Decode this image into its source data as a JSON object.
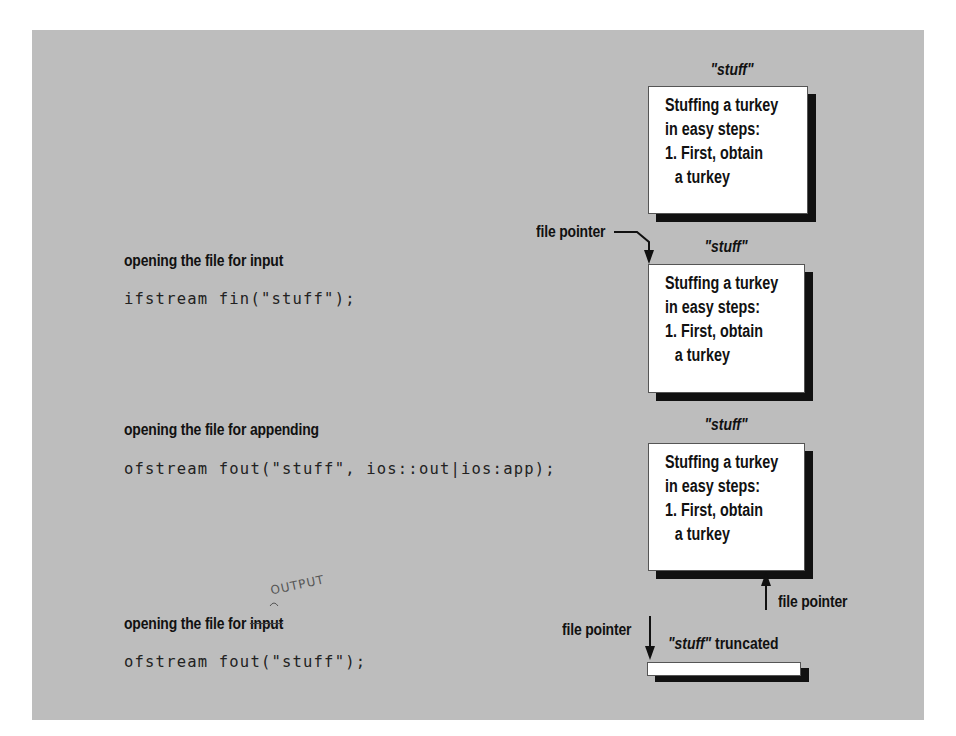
{
  "diagram": {
    "file_name": "\"stuff\"",
    "file_contents": [
      "Stuffing a turkey",
      "in easy steps:",
      "1. First, obtain",
      "a turkey"
    ],
    "original_file": {
      "name": "\"stuff\""
    },
    "sections": [
      {
        "caption": "opening the file for input",
        "code": "ifstream fin(\"stuff\");",
        "file_name": "\"stuff\"",
        "pointer_label": "file pointer",
        "pointer_position": "start"
      },
      {
        "caption": "opening the file for appending",
        "code": "ofstream fout(\"stuff\", ios::out|ios:app);",
        "file_name": "\"stuff\"",
        "pointer_label": "file pointer",
        "pointer_position": "end"
      },
      {
        "caption_prefix": "opening the file for ",
        "caption_struck": "input",
        "handwritten_correction": "OUTPUT",
        "code": "ofstream fout(\"stuff\");",
        "file_name": "\"stuff\"",
        "file_suffix": " truncated",
        "pointer_label": "file pointer",
        "pointer_position": "start"
      }
    ]
  }
}
